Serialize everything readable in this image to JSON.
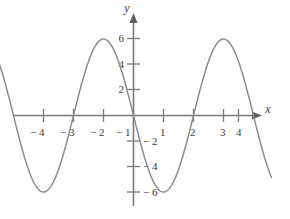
{
  "chart_data": {
    "type": "line",
    "title": "",
    "subtitle": "",
    "xlabel": "x",
    "ylabel": "y",
    "xlim": [
      -4.6,
      4.6
    ],
    "ylim": [
      -7.6,
      7.2
    ],
    "grid": false,
    "legend": null,
    "legend_position": "none",
    "x_ticks": [
      -4,
      -3,
      -2,
      -1,
      1,
      2,
      3,
      4
    ],
    "x_tick_labels": [
      "− 4",
      "− 3",
      "− 2",
      "− 1",
      "1",
      "2",
      "3",
      "4"
    ],
    "y_ticks": [
      -6,
      -4,
      -2,
      2,
      4,
      6
    ],
    "y_tick_labels": [
      "− 6",
      "− 4",
      "− 2",
      "2",
      "4",
      "6"
    ],
    "series": [
      {
        "name": "curve",
        "color": "#8d8d8d",
        "equation": "y = -6 sin(pi x / 2)",
        "amplitude": 6,
        "period": 4,
        "zeros": [
          -4,
          -2,
          0,
          2,
          4
        ],
        "maxima": [
          [
            -3,
            6
          ],
          [
            1,
            6
          ]
        ],
        "minima": [
          [
            -1,
            -6
          ],
          [
            3,
            -6
          ]
        ],
        "x": [
          -4.6,
          -4.4,
          -4.2,
          -4,
          -3.8,
          -3.6,
          -3.4,
          -3.2,
          -3,
          -2.8,
          -2.6,
          -2.4,
          -2.2,
          -2,
          -1.8,
          -1.6,
          -1.4,
          -1.2,
          -1,
          -0.8,
          -0.6,
          -0.4,
          -0.2,
          0,
          0.2,
          0.4,
          0.6,
          0.8,
          1,
          1.2,
          1.4,
          1.6,
          1.8,
          2,
          2.2,
          2.4,
          2.6,
          2.8,
          3,
          3.2,
          3.4,
          3.6,
          3.8,
          4,
          4.2,
          4.4,
          4.6
        ],
        "y": [
          -1.85,
          -3.53,
          -4.85,
          -5.71,
          -6,
          -5.71,
          -4.85,
          -3.53,
          -1.85,
          0,
          1.85,
          3.53,
          4.85,
          5.71,
          6,
          5.71,
          4.85,
          3.53,
          1.85,
          0,
          -1.85,
          -3.53,
          -4.85,
          -5.71,
          -6,
          -5.71,
          -4.85,
          -3.53,
          -1.85,
          0,
          1.85,
          3.53,
          4.85,
          5.71,
          6,
          5.71,
          4.85,
          3.53,
          1.85,
          0,
          -1.85,
          -3.53,
          -4.85,
          -5.71,
          -6,
          -5.71,
          -4.85
        ]
      }
    ],
    "colors": {
      "curve": "#8d8d8d",
      "axis": "#7a7a7a",
      "text": "#3b3b3b",
      "background": "#ffffff"
    }
  },
  "axes": {
    "x_axis_name": "x",
    "y_axis_name": "y"
  }
}
